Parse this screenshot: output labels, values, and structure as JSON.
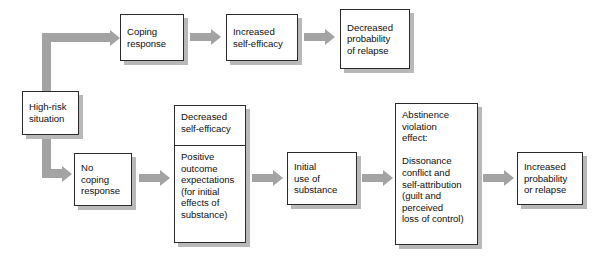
{
  "diagram": {
    "type": "flowchart",
    "colors": {
      "box_border": "#2b2b2b",
      "box_fill": "#ffffff",
      "box_shadow": "#b9b9b9",
      "arrow": "#a3a3a3",
      "text": "#111111",
      "background": "#ffffff"
    },
    "nodes": {
      "high_risk": {
        "lines": [
          "High-risk",
          "situation"
        ]
      },
      "coping_response": {
        "lines": [
          "Coping",
          "response"
        ]
      },
      "increased_self_efficacy": {
        "lines": [
          "Increased",
          "self-efficacy"
        ]
      },
      "decreased_probability_relapse": {
        "lines": [
          "Decreased",
          "probability",
          "of relapse"
        ]
      },
      "no_coping_response": {
        "lines": [
          "No",
          "coping",
          "response"
        ]
      },
      "decreased_self_efficacy": {
        "lines": [
          "Decreased",
          "self-efficacy"
        ]
      },
      "positive_outcome_expectations": {
        "lines": [
          "Positive",
          "outcome",
          "expectations",
          "(for initial",
          "effects of",
          "substance)"
        ]
      },
      "initial_use_substance": {
        "lines": [
          "Initial",
          "use of",
          "substance"
        ]
      },
      "abstinence_violation_effect": {
        "lines": [
          "Abstinence",
          "violation",
          "effect:",
          "",
          "Dissonance",
          "conflict and",
          "self-attribution",
          "(guilt and",
          "perceived",
          "loss of control)"
        ]
      },
      "increased_probability_relapse": {
        "lines": [
          "Increased",
          "probability",
          "or relapse"
        ]
      }
    },
    "edges": [
      {
        "name": "high-risk-to-coping-response",
        "kind": "elbow-up-right"
      },
      {
        "name": "coping-response-to-increased-self-efficacy",
        "kind": "arrow-right"
      },
      {
        "name": "increased-self-efficacy-to-decreased-probability",
        "kind": "arrow-right"
      },
      {
        "name": "high-risk-to-no-coping-response",
        "kind": "elbow-down-right"
      },
      {
        "name": "no-coping-response-to-expectations",
        "kind": "arrow-right"
      },
      {
        "name": "expectations-to-initial-use",
        "kind": "arrow-right"
      },
      {
        "name": "initial-use-to-ave",
        "kind": "arrow-right"
      },
      {
        "name": "ave-to-increased-probability",
        "kind": "arrow-right"
      }
    ]
  }
}
